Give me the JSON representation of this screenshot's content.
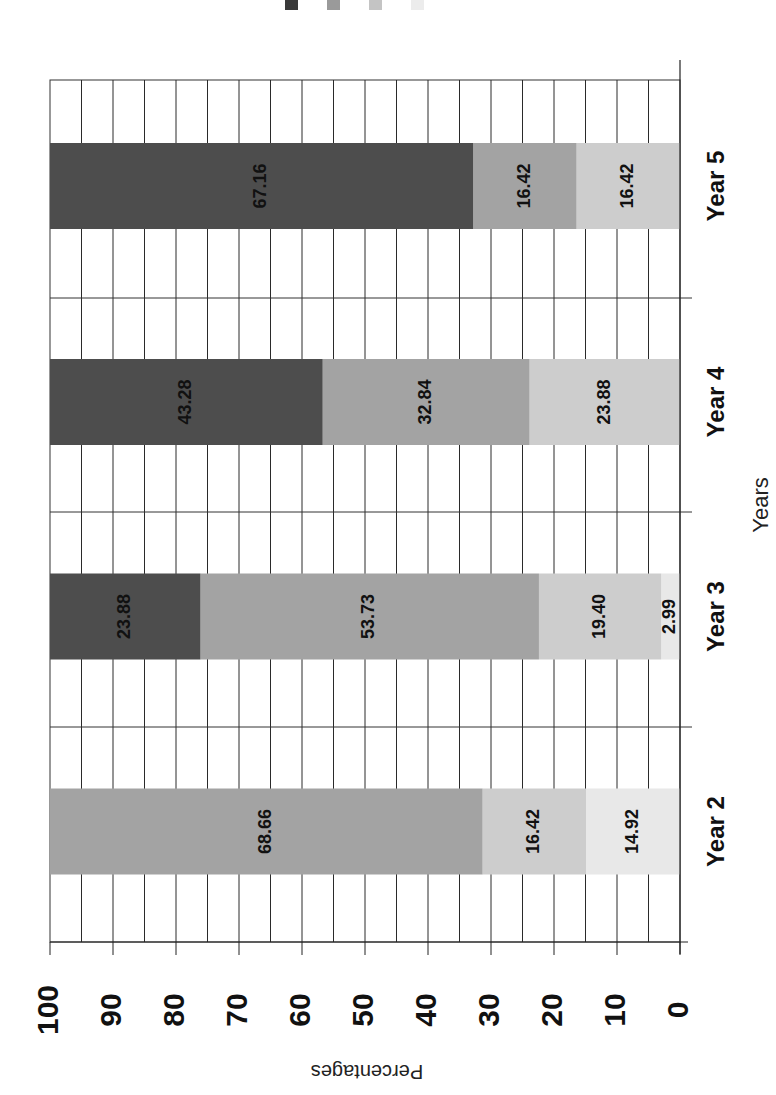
{
  "chart_data": {
    "type": "bar",
    "stacked": true,
    "orientation_note": "Page rotated 90 degrees clockwise; value axis runs along bottom (100 at left, 0 at right), categories on right side",
    "title": "",
    "xlabel": "Years",
    "ylabel": "Percentages",
    "ylim": [
      0,
      100
    ],
    "yticks": [
      0,
      10,
      20,
      30,
      40,
      50,
      60,
      70,
      80,
      90,
      100
    ],
    "grid": true,
    "legend_position": "top (cut off, labels not legible)",
    "categories": [
      "Year 2",
      "Year 3",
      "Year 4",
      "Year 5"
    ],
    "series": [
      {
        "name": "Series 1",
        "color": "#4d4d4d",
        "values": [
          0,
          23.88,
          43.28,
          67.16
        ]
      },
      {
        "name": "Series 2",
        "color": "#a3a3a3",
        "values": [
          68.66,
          53.73,
          32.84,
          16.42
        ]
      },
      {
        "name": "Series 3",
        "color": "#cdcdcd",
        "values": [
          16.42,
          19.4,
          23.88,
          16.42
        ]
      },
      {
        "name": "Series 4",
        "color": "#e8e8e8",
        "values": [
          14.92,
          2.99,
          0,
          0
        ]
      }
    ],
    "data_labels": {
      "Year 2": [
        "68.66",
        "16.42",
        "14.92"
      ],
      "Year 3": [
        "23.88",
        "53.73",
        "19.40",
        "2.99"
      ],
      "Year 4": [
        "43.28",
        "32.84",
        "23.88"
      ],
      "Year 5": [
        "67.16",
        "16.42",
        "16.42"
      ]
    }
  },
  "axis": {
    "x_title": "Years",
    "y_title": "Percentages",
    "tick_labels": [
      "100",
      "90",
      "80",
      "70",
      "60",
      "50",
      "40",
      "30",
      "20",
      "10",
      "0"
    ],
    "category_labels": [
      "Year 5",
      "Year 4",
      "Year 3",
      "Year 2"
    ]
  },
  "legend": {
    "swatches": [
      "#3a3a3a",
      "#9a9a9a",
      "#c4c4c4",
      "#ececec"
    ]
  }
}
